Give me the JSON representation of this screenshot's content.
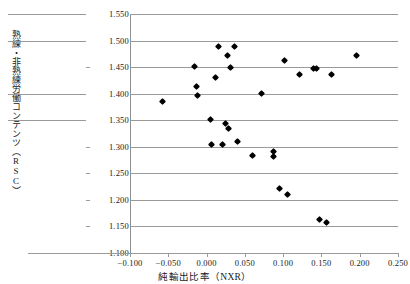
{
  "chart_data": {
    "type": "scatter",
    "title": "",
    "xlabel": "純輸出比率（NXR）",
    "ylabel": "熟練・非熟練労働コンテンツ（RSC）",
    "xlim": [
      -0.1,
      0.25
    ],
    "ylim": [
      1.1,
      1.55
    ],
    "xticks": [
      "-0.100",
      "-0.050",
      "0.000",
      "0.050",
      "0.100",
      "0.150",
      "0.200",
      "0.250"
    ],
    "xtick_values": [
      -0.1,
      -0.05,
      0.0,
      0.05,
      0.1,
      0.15,
      0.2,
      0.25
    ],
    "yticks": [
      "1.100",
      "1.150",
      "1.200",
      "1.250",
      "1.300",
      "1.350",
      "1.400",
      "1.450",
      "1.500",
      "1.550"
    ],
    "ytick_values": [
      1.1,
      1.15,
      1.2,
      1.25,
      1.3,
      1.35,
      1.4,
      1.45,
      1.5,
      1.55
    ],
    "grid": true,
    "legend": "none",
    "marker": "diamond",
    "marker_color": "#000000",
    "points": [
      {
        "x": -0.058,
        "y": 1.385
      },
      {
        "x": -0.016,
        "y": 1.452
      },
      {
        "x": -0.013,
        "y": 1.414
      },
      {
        "x": -0.012,
        "y": 1.397
      },
      {
        "x": 0.005,
        "y": 1.352
      },
      {
        "x": 0.006,
        "y": 1.305
      },
      {
        "x": 0.012,
        "y": 1.431
      },
      {
        "x": 0.015,
        "y": 1.488
      },
      {
        "x": 0.021,
        "y": 1.305
      },
      {
        "x": 0.025,
        "y": 1.343
      },
      {
        "x": 0.027,
        "y": 1.472
      },
      {
        "x": 0.029,
        "y": 1.334
      },
      {
        "x": 0.031,
        "y": 1.449
      },
      {
        "x": 0.036,
        "y": 1.488
      },
      {
        "x": 0.041,
        "y": 1.309
      },
      {
        "x": 0.06,
        "y": 1.284
      },
      {
        "x": 0.072,
        "y": 1.401
      },
      {
        "x": 0.087,
        "y": 1.291
      },
      {
        "x": 0.088,
        "y": 1.281
      },
      {
        "x": 0.095,
        "y": 1.222
      },
      {
        "x": 0.102,
        "y": 1.462
      },
      {
        "x": 0.106,
        "y": 1.211
      },
      {
        "x": 0.122,
        "y": 1.437
      },
      {
        "x": 0.139,
        "y": 1.447
      },
      {
        "x": 0.143,
        "y": 1.447
      },
      {
        "x": 0.147,
        "y": 1.163
      },
      {
        "x": 0.157,
        "y": 1.158
      },
      {
        "x": 0.163,
        "y": 1.437
      },
      {
        "x": 0.196,
        "y": 1.472
      }
    ]
  }
}
